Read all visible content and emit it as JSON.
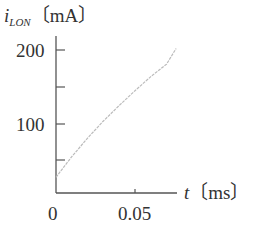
{
  "chart_data": {
    "type": "line",
    "title": "",
    "ylabel_symbol": "i",
    "ylabel_subscript": "LON",
    "ylabel_unit": "〔mA〕",
    "xlabel_symbol": "t",
    "xlabel_unit": "〔ms〕",
    "y_tick_labels": [
      "100",
      "200"
    ],
    "y_ticks": [
      50,
      100,
      150,
      200
    ],
    "x_tick_labels": [
      "0",
      "0.05"
    ],
    "x_ticks": [
      0,
      0.05
    ],
    "xlim": [
      0,
      0.076
    ],
    "ylim": [
      0,
      212
    ],
    "grid": false,
    "legend": null,
    "series": [
      {
        "name": "i_LON",
        "x": [
          0,
          0.005,
          0.01,
          0.02,
          0.03,
          0.04,
          0.05,
          0.06,
          0.07,
          0.076
        ],
        "values": [
          28,
          42,
          56,
          81,
          104,
          125,
          145,
          164,
          181,
          202
        ]
      }
    ],
    "colors": {
      "axis": "#555555",
      "curve": "#bbbbbb",
      "text": "#333333"
    }
  }
}
